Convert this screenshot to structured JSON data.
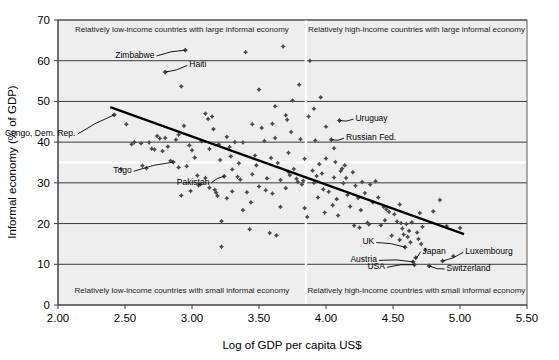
{
  "chart_data": {
    "type": "scatter",
    "title": "",
    "xlabel": "Log of GDP per capita US$",
    "ylabel": "Informal economy (% of GDP)",
    "xlim": [
      2.0,
      5.5
    ],
    "ylim": [
      0,
      70
    ],
    "xticks": [
      "2.00",
      "2.50",
      "3.00",
      "3.50",
      "4.00",
      "4.50",
      "5.00",
      "5.50"
    ],
    "xtick_values": [
      2.0,
      2.5,
      3.0,
      3.5,
      4.0,
      4.5,
      5.0,
      5.5
    ],
    "yticks": [
      "0",
      "10",
      "20",
      "30",
      "40",
      "50",
      "60",
      "70"
    ],
    "ytick_values": [
      0,
      10,
      20,
      30,
      40,
      50,
      60,
      70
    ],
    "grid": true,
    "grid_orientation": "horizontal",
    "legend": "none",
    "quadrant_divider_x": 3.85,
    "quadrant_divider_y": 35,
    "quadrant_labels": [
      "Relatively low-income countries with large informal economy",
      "Relatively high-income countries with large informal economy",
      "Relatively low-income countries with small informal economy",
      "Relatively high-income countries with small informal economy"
    ],
    "trendline": {
      "label": "linear trend",
      "x0": 2.39,
      "y0": 48.6,
      "x1": 5.03,
      "y1": 17.4
    },
    "annotations": [
      {
        "label": "Zimbabwe",
        "x": 2.95,
        "y": 62.6,
        "text_x": 2.72,
        "text_y": 61.4
      },
      {
        "label": "Haiti",
        "x": 2.8,
        "y": 57.2,
        "text_x": 2.98,
        "text_y": 59.1
      },
      {
        "label": "Congo, Dem. Rep.",
        "x": 2.42,
        "y": 46.7,
        "text_x": 2.13,
        "text_y": 42.2
      },
      {
        "label": "Togo",
        "x": 2.86,
        "y": 35.1,
        "text_x": 2.55,
        "text_y": 33.1
      },
      {
        "label": "Pakistan",
        "x": 3.24,
        "y": 31.6,
        "text_x": 3.13,
        "text_y": 30.3
      },
      {
        "label": "Uruguay",
        "x": 4.1,
        "y": 45.3,
        "text_x": 4.22,
        "text_y": 45.9
      },
      {
        "label": "Russian Fed.",
        "x": 4.04,
        "y": 40.6,
        "text_x": 4.15,
        "text_y": 41.2
      },
      {
        "label": "UK",
        "x": 4.59,
        "y": 14.2,
        "text_x": 4.36,
        "text_y": 15.6
      },
      {
        "label": "Japan",
        "x": 4.67,
        "y": 11.6,
        "text_x": 4.72,
        "text_y": 13.3
      },
      {
        "label": "Austria",
        "x": 4.65,
        "y": 10.6,
        "text_x": 4.38,
        "text_y": 11.2
      },
      {
        "label": "USA",
        "x": 4.66,
        "y": 9.9,
        "text_x": 4.44,
        "text_y": 9.5
      },
      {
        "label": "Luxembourg",
        "x": 4.87,
        "y": 10.8,
        "text_x": 5.04,
        "text_y": 13.2
      },
      {
        "label": "Switzerland",
        "x": 4.77,
        "y": 9.6,
        "text_x": 4.9,
        "text_y": 9.1
      }
    ],
    "points": [
      {
        "x": 2.42,
        "y": 46.7
      },
      {
        "x": 2.51,
        "y": 44.4
      },
      {
        "x": 2.57,
        "y": 40.0
      },
      {
        "x": 2.62,
        "y": 39.7
      },
      {
        "x": 2.68,
        "y": 39.9
      },
      {
        "x": 2.7,
        "y": 38.4
      },
      {
        "x": 2.72,
        "y": 38.2
      },
      {
        "x": 2.74,
        "y": 41.5
      },
      {
        "x": 2.76,
        "y": 40.9
      },
      {
        "x": 2.78,
        "y": 37.8
      },
      {
        "x": 2.8,
        "y": 57.2
      },
      {
        "x": 2.8,
        "y": 41.0
      },
      {
        "x": 2.82,
        "y": 38.9
      },
      {
        "x": 2.84,
        "y": 35.4
      },
      {
        "x": 2.86,
        "y": 35.1
      },
      {
        "x": 2.88,
        "y": 40.6
      },
      {
        "x": 2.9,
        "y": 41.8
      },
      {
        "x": 2.92,
        "y": 53.7
      },
      {
        "x": 2.94,
        "y": 44.0
      },
      {
        "x": 2.95,
        "y": 62.6
      },
      {
        "x": 2.96,
        "y": 34.1
      },
      {
        "x": 2.98,
        "y": 39.2
      },
      {
        "x": 3.0,
        "y": 38.0
      },
      {
        "x": 3.02,
        "y": 36.2
      },
      {
        "x": 3.04,
        "y": 31.8
      },
      {
        "x": 3.06,
        "y": 29.6
      },
      {
        "x": 3.1,
        "y": 47.0
      },
      {
        "x": 3.12,
        "y": 45.7
      },
      {
        "x": 3.13,
        "y": 28.8
      },
      {
        "x": 3.15,
        "y": 46.3
      },
      {
        "x": 3.16,
        "y": 43.2
      },
      {
        "x": 3.17,
        "y": 28.3
      },
      {
        "x": 3.18,
        "y": 27.6
      },
      {
        "x": 3.19,
        "y": 26.8
      },
      {
        "x": 3.21,
        "y": 35.6
      },
      {
        "x": 3.22,
        "y": 20.6
      },
      {
        "x": 3.22,
        "y": 14.3
      },
      {
        "x": 3.24,
        "y": 31.6
      },
      {
        "x": 3.26,
        "y": 41.3
      },
      {
        "x": 3.28,
        "y": 38.8
      },
      {
        "x": 3.3,
        "y": 33.3
      },
      {
        "x": 3.32,
        "y": 40.0
      },
      {
        "x": 3.34,
        "y": 31.5
      },
      {
        "x": 3.36,
        "y": 30.8
      },
      {
        "x": 3.38,
        "y": 39.9
      },
      {
        "x": 3.4,
        "y": 62.1
      },
      {
        "x": 3.41,
        "y": 27.7
      },
      {
        "x": 3.43,
        "y": 18.6
      },
      {
        "x": 3.45,
        "y": 44.4
      },
      {
        "x": 3.47,
        "y": 36.7
      },
      {
        "x": 3.48,
        "y": 34.3
      },
      {
        "x": 3.5,
        "y": 52.9
      },
      {
        "x": 3.52,
        "y": 43.5
      },
      {
        "x": 3.54,
        "y": 40.3
      },
      {
        "x": 3.56,
        "y": 31.1
      },
      {
        "x": 3.58,
        "y": 17.7
      },
      {
        "x": 3.6,
        "y": 44.5
      },
      {
        "x": 3.62,
        "y": 41.0
      },
      {
        "x": 3.63,
        "y": 17.1
      },
      {
        "x": 3.64,
        "y": 34.9
      },
      {
        "x": 3.66,
        "y": 30.7
      },
      {
        "x": 3.68,
        "y": 63.5
      },
      {
        "x": 3.7,
        "y": 46.6
      },
      {
        "x": 3.71,
        "y": 45.5
      },
      {
        "x": 3.72,
        "y": 32.7
      },
      {
        "x": 3.73,
        "y": 31.9
      },
      {
        "x": 3.74,
        "y": 42.5
      },
      {
        "x": 3.76,
        "y": 33.4
      },
      {
        "x": 3.78,
        "y": 31.0
      },
      {
        "x": 3.79,
        "y": 30.2
      },
      {
        "x": 3.8,
        "y": 54.1
      },
      {
        "x": 3.81,
        "y": 40.7
      },
      {
        "x": 3.82,
        "y": 29.6
      },
      {
        "x": 3.83,
        "y": 30.5
      },
      {
        "x": 3.84,
        "y": 23.8
      },
      {
        "x": 3.88,
        "y": 60.0
      },
      {
        "x": 3.9,
        "y": 33.0
      },
      {
        "x": 3.91,
        "y": 30.0
      },
      {
        "x": 3.92,
        "y": 40.4
      },
      {
        "x": 3.93,
        "y": 31.7
      },
      {
        "x": 3.94,
        "y": 26.4
      },
      {
        "x": 3.96,
        "y": 51.0
      },
      {
        "x": 3.97,
        "y": 32.3
      },
      {
        "x": 3.98,
        "y": 28.4
      },
      {
        "x": 3.99,
        "y": 22.7
      },
      {
        "x": 4.0,
        "y": 36.0
      },
      {
        "x": 4.02,
        "y": 27.8
      },
      {
        "x": 4.04,
        "y": 40.6
      },
      {
        "x": 4.05,
        "y": 24.5
      },
      {
        "x": 4.06,
        "y": 31.3
      },
      {
        "x": 4.07,
        "y": 35.1
      },
      {
        "x": 4.08,
        "y": 26.0
      },
      {
        "x": 4.1,
        "y": 45.3
      },
      {
        "x": 4.11,
        "y": 32.9
      },
      {
        "x": 4.12,
        "y": 33.5
      },
      {
        "x": 4.13,
        "y": 29.9
      },
      {
        "x": 4.14,
        "y": 34.3
      },
      {
        "x": 4.15,
        "y": 31.2
      },
      {
        "x": 4.16,
        "y": 27.0
      },
      {
        "x": 4.18,
        "y": 24.2
      },
      {
        "x": 4.2,
        "y": 32.6
      },
      {
        "x": 4.21,
        "y": 19.5
      },
      {
        "x": 4.22,
        "y": 29.3
      },
      {
        "x": 4.24,
        "y": 26.3
      },
      {
        "x": 4.25,
        "y": 19.0
      },
      {
        "x": 4.27,
        "y": 30.2
      },
      {
        "x": 4.29,
        "y": 27.5
      },
      {
        "x": 4.31,
        "y": 20.2
      },
      {
        "x": 4.32,
        "y": 19.8
      },
      {
        "x": 4.33,
        "y": 29.6
      },
      {
        "x": 4.35,
        "y": 25.2
      },
      {
        "x": 4.37,
        "y": 30.4
      },
      {
        "x": 4.39,
        "y": 26.4
      },
      {
        "x": 4.41,
        "y": 19.6
      },
      {
        "x": 4.43,
        "y": 24.1
      },
      {
        "x": 4.45,
        "y": 23.5
      },
      {
        "x": 4.47,
        "y": 22.9
      },
      {
        "x": 4.49,
        "y": 17.0
      },
      {
        "x": 4.51,
        "y": 22.3
      },
      {
        "x": 4.53,
        "y": 20.5
      },
      {
        "x": 4.55,
        "y": 16.0
      },
      {
        "x": 4.56,
        "y": 20.1
      },
      {
        "x": 4.57,
        "y": 18.8
      },
      {
        "x": 4.58,
        "y": 17.3
      },
      {
        "x": 4.59,
        "y": 14.2
      },
      {
        "x": 4.6,
        "y": 19.9
      },
      {
        "x": 4.61,
        "y": 16.7
      },
      {
        "x": 4.62,
        "y": 18.2
      },
      {
        "x": 4.63,
        "y": 15.4
      },
      {
        "x": 4.64,
        "y": 20.3
      },
      {
        "x": 4.65,
        "y": 10.6
      },
      {
        "x": 4.66,
        "y": 9.9
      },
      {
        "x": 4.67,
        "y": 11.6
      },
      {
        "x": 4.68,
        "y": 17.8
      },
      {
        "x": 4.7,
        "y": 22.6
      },
      {
        "x": 4.72,
        "y": 19.2
      },
      {
        "x": 4.74,
        "y": 13.5
      },
      {
        "x": 4.77,
        "y": 9.6
      },
      {
        "x": 4.8,
        "y": 23.0
      },
      {
        "x": 4.85,
        "y": 25.8
      },
      {
        "x": 4.87,
        "y": 10.8
      },
      {
        "x": 4.9,
        "y": 19.4
      },
      {
        "x": 4.95,
        "y": 12.0
      },
      {
        "x": 5.0,
        "y": 18.9
      },
      {
        "x": 2.47,
        "y": 33.4
      },
      {
        "x": 2.63,
        "y": 34.2
      },
      {
        "x": 2.9,
        "y": 33.8
      },
      {
        "x": 2.92,
        "y": 26.9
      },
      {
        "x": 3.05,
        "y": 29.4
      },
      {
        "x": 3.35,
        "y": 34.8
      },
      {
        "x": 3.5,
        "y": 29.1
      },
      {
        "x": 3.55,
        "y": 28.2
      },
      {
        "x": 3.6,
        "y": 27.4
      },
      {
        "x": 3.7,
        "y": 28.7
      },
      {
        "x": 3.45,
        "y": 32.1
      },
      {
        "x": 3.3,
        "y": 27.9
      },
      {
        "x": 3.26,
        "y": 26.2
      },
      {
        "x": 3.1,
        "y": 31.2
      },
      {
        "x": 2.99,
        "y": 28.0
      },
      {
        "x": 3.44,
        "y": 25.2
      },
      {
        "x": 3.38,
        "y": 23.3
      },
      {
        "x": 3.66,
        "y": 24.1
      },
      {
        "x": 3.86,
        "y": 21.6
      },
      {
        "x": 3.95,
        "y": 34.6
      },
      {
        "x": 4.06,
        "y": 38.5
      },
      {
        "x": 4.0,
        "y": 43.8
      },
      {
        "x": 3.87,
        "y": 46.3
      },
      {
        "x": 3.91,
        "y": 48.2
      },
      {
        "x": 3.75,
        "y": 50.2
      },
      {
        "x": 3.62,
        "y": 48.8
      },
      {
        "x": 2.66,
        "y": 33.6
      },
      {
        "x": 2.55,
        "y": 39.5
      },
      {
        "x": 3.07,
        "y": 40.2
      },
      {
        "x": 3.13,
        "y": 38.3
      },
      {
        "x": 3.2,
        "y": 39.5
      },
      {
        "x": 3.29,
        "y": 36.5
      },
      {
        "x": 3.59,
        "y": 36.1
      },
      {
        "x": 3.72,
        "y": 37.4
      },
      {
        "x": 3.84,
        "y": 35.9
      },
      {
        "x": 4.09,
        "y": 22.0
      },
      {
        "x": 4.26,
        "y": 23.3
      },
      {
        "x": 4.44,
        "y": 20.8
      },
      {
        "x": 4.55,
        "y": 24.7
      },
      {
        "x": 4.69,
        "y": 16.2
      },
      {
        "x": 4.71,
        "y": 15.0
      }
    ]
  }
}
